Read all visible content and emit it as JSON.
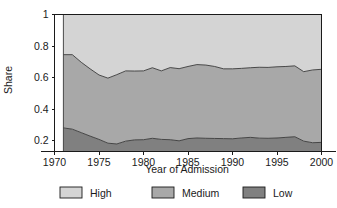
{
  "chart_data": {
    "type": "area",
    "stacked": true,
    "title": "",
    "xlabel": "Year of Admission",
    "ylabel": "Share",
    "xlim": [
      1970,
      2000
    ],
    "ylim": [
      0.17,
      1.0
    ],
    "grid": false,
    "legend_position": "bottom",
    "xticks": [
      1970,
      1975,
      1980,
      1985,
      1990,
      1995,
      2000
    ],
    "xtick_labels": [
      "1970",
      "1975",
      "1980",
      "1985",
      "1990",
      "1995",
      "2000"
    ],
    "yticks": [
      0.2,
      0.4,
      0.6,
      0.8,
      1
    ],
    "ytick_labels": [
      "0.2",
      "0.4",
      "0.6",
      "0.8",
      "1"
    ],
    "x": [
      1971,
      1972,
      1973,
      1974,
      1975,
      1976,
      1977,
      1978,
      1979,
      1980,
      1981,
      1982,
      1983,
      1984,
      1985,
      1986,
      1987,
      1988,
      1989,
      1990,
      1991,
      1992,
      1993,
      1994,
      1995,
      1996,
      1997,
      1998,
      1999,
      2000
    ],
    "series": [
      {
        "name": "Low",
        "color": "#808080",
        "values": [
          0.28,
          0.272,
          0.25,
          0.228,
          0.207,
          0.183,
          0.178,
          0.196,
          0.204,
          0.205,
          0.214,
          0.207,
          0.205,
          0.198,
          0.212,
          0.216,
          0.214,
          0.213,
          0.212,
          0.211,
          0.216,
          0.22,
          0.215,
          0.214,
          0.216,
          0.22,
          0.224,
          0.196,
          0.186,
          0.188
        ]
      },
      {
        "name": "Medium",
        "color": "#a8a8a8",
        "values": [
          0.465,
          0.473,
          0.447,
          0.427,
          0.409,
          0.413,
          0.44,
          0.446,
          0.437,
          0.437,
          0.448,
          0.435,
          0.458,
          0.458,
          0.458,
          0.466,
          0.465,
          0.457,
          0.443,
          0.444,
          0.442,
          0.442,
          0.45,
          0.45,
          0.452,
          0.45,
          0.45,
          0.441,
          0.462,
          0.464
        ]
      },
      {
        "name": "High",
        "color": "#d4d4d4",
        "values": [
          0.255,
          0.255,
          0.303,
          0.345,
          0.384,
          0.404,
          0.382,
          0.358,
          0.359,
          0.358,
          0.338,
          0.358,
          0.337,
          0.344,
          0.33,
          0.318,
          0.321,
          0.33,
          0.345,
          0.345,
          0.342,
          0.338,
          0.335,
          0.336,
          0.332,
          0.33,
          0.326,
          0.363,
          0.352,
          0.348
        ]
      }
    ],
    "cumulative_low_top": [
      0.28,
      0.272,
      0.25,
      0.228,
      0.207,
      0.183,
      0.178,
      0.196,
      0.204,
      0.205,
      0.214,
      0.207,
      0.205,
      0.198,
      0.212,
      0.216,
      0.214,
      0.213,
      0.212,
      0.211,
      0.216,
      0.22,
      0.215,
      0.214,
      0.216,
      0.22,
      0.224,
      0.196,
      0.186,
      0.188
    ],
    "cumulative_medium_top": [
      0.745,
      0.745,
      0.697,
      0.655,
      0.616,
      0.596,
      0.618,
      0.642,
      0.641,
      0.642,
      0.662,
      0.642,
      0.663,
      0.656,
      0.67,
      0.682,
      0.679,
      0.67,
      0.655,
      0.655,
      0.658,
      0.662,
      0.665,
      0.664,
      0.668,
      0.67,
      0.674,
      0.637,
      0.648,
      0.652
    ]
  },
  "legend": {
    "items": [
      {
        "label": "High",
        "color": "#d4d4d4"
      },
      {
        "label": "Medium",
        "color": "#a8a8a8"
      },
      {
        "label": "Low",
        "color": "#808080"
      }
    ]
  }
}
